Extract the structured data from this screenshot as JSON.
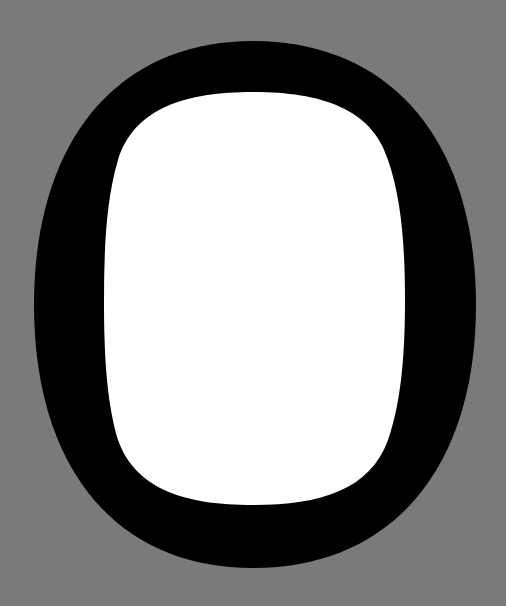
{
  "glyph": {
    "character": "O",
    "colors": {
      "background": "#7a7a7a",
      "stroke": "#000000",
      "counter": "#ffffff"
    }
  }
}
